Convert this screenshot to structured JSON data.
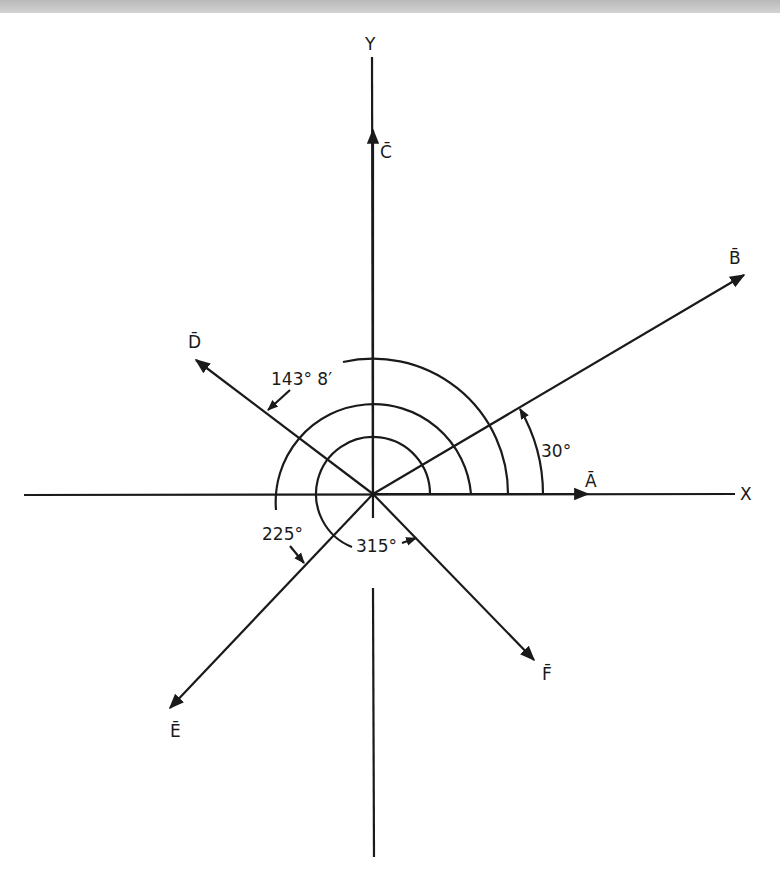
{
  "diagram": {
    "type": "vector-angle-diagram",
    "axes": {
      "x_label": "X",
      "y_label": "Y"
    },
    "vectors": [
      {
        "name": "A",
        "label": "Ā",
        "angle_deg": 0
      },
      {
        "name": "B",
        "label": "B̄",
        "angle_deg": 30
      },
      {
        "name": "C",
        "label": "C̄",
        "angle_deg": 90
      },
      {
        "name": "D",
        "label": "D̄",
        "angle_deg": 143.13
      },
      {
        "name": "E",
        "label": "Ē",
        "angle_deg": 225
      },
      {
        "name": "F",
        "label": "F̄",
        "angle_deg": 315
      }
    ],
    "angle_annotations": [
      {
        "text": "30°",
        "for": "B"
      },
      {
        "text": "143° 8′",
        "for": "D"
      },
      {
        "text": "225°",
        "for": "E"
      },
      {
        "text": "315°",
        "for": "F"
      }
    ]
  }
}
